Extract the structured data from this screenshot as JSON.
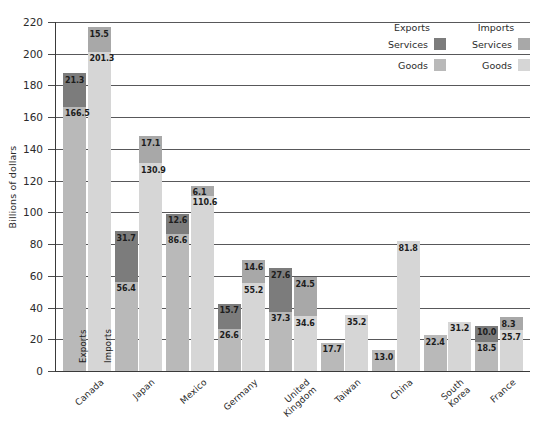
{
  "chart_data": {
    "type": "bar",
    "subtype": "grouped-stacked",
    "title": "",
    "subtitle": "",
    "xlabel": "",
    "ylabel": "Billions of dollars",
    "ylim": [
      0,
      220
    ],
    "ytick_step": 20,
    "yticks": [
      "0",
      "20",
      "40",
      "60",
      "80",
      "100",
      "120",
      "140",
      "160",
      "180",
      "200",
      "220"
    ],
    "grid": true,
    "grid_axis": "y",
    "legend_position": "top-right",
    "categories": [
      "Canada",
      "Japan",
      "Mexico",
      "Germany",
      "United Kingdom",
      "Taiwan",
      "China",
      "South Korea",
      "France"
    ],
    "series": [
      {
        "name": "Exports Goods",
        "group": "Exports",
        "part": "Goods",
        "color": "#b9b9b9",
        "values": [
          166.5,
          56.4,
          86.6,
          26.6,
          37.3,
          17.7,
          13.0,
          22.4,
          18.5
        ]
      },
      {
        "name": "Exports Services",
        "group": "Exports",
        "part": "Services",
        "color": "#7c7c7c",
        "values": [
          21.3,
          31.7,
          12.6,
          15.7,
          27.6,
          null,
          null,
          null,
          10.0
        ]
      },
      {
        "name": "Imports Goods",
        "group": "Imports",
        "part": "Goods",
        "color": "#d6d6d6",
        "values": [
          201.3,
          130.9,
          110.6,
          55.2,
          34.6,
          35.2,
          81.8,
          31.2,
          25.7
        ]
      },
      {
        "name": "Imports Services",
        "group": "Imports",
        "part": "Services",
        "color": "#a8a8a8",
        "values": [
          15.5,
          17.1,
          6.1,
          14.6,
          24.5,
          null,
          null,
          null,
          8.3
        ]
      }
    ],
    "bar_inline_labels": {
      "canada_exports": "Exports",
      "canada_imports": "Imports"
    },
    "data_labels": {
      "Canada": {
        "exports_goods": "166.5",
        "exports_services": "21.3",
        "imports_goods": "201.3",
        "imports_services": "15.5"
      },
      "Japan": {
        "exports_goods": "56.4",
        "exports_services": "31.7",
        "imports_goods": "130.9",
        "imports_services": "17.1"
      },
      "Mexico": {
        "exports_goods": "86.6",
        "exports_services": "12.6",
        "imports_goods": "110.6",
        "imports_services": "6.1"
      },
      "Germany": {
        "exports_goods": "26.6",
        "exports_services": "15.7",
        "imports_goods": "55.2",
        "imports_services": "14.6"
      },
      "United Kingdom": {
        "exports_goods": "37.3",
        "exports_services": "27.6",
        "imports_goods": "34.6",
        "imports_services": "24.5"
      },
      "Taiwan": {
        "exports_goods": "17.7",
        "exports_services": "",
        "imports_goods": "35.2",
        "imports_services": ""
      },
      "China": {
        "exports_goods": "13.0",
        "exports_services": "",
        "imports_goods": "81.8",
        "imports_services": ""
      },
      "South Korea": {
        "exports_goods": "22.4",
        "exports_services": "",
        "imports_goods": "31.2",
        "imports_services": ""
      },
      "France": {
        "exports_goods": "18.5",
        "exports_services": "10.0",
        "imports_goods": "25.7",
        "imports_services": "8.3"
      }
    }
  },
  "legend": {
    "exports_header": "Exports",
    "imports_header": "Imports",
    "exports_services_label": "Services",
    "exports_goods_label": "Goods",
    "imports_services_label": "Services",
    "imports_goods_label": "Goods",
    "colors": {
      "exports_services": "#7c7c7c",
      "exports_goods": "#b9b9b9",
      "imports_services": "#a8a8a8",
      "imports_goods": "#d6d6d6"
    }
  }
}
